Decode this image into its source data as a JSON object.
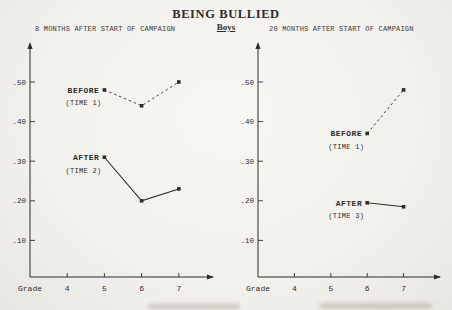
{
  "page": {
    "title": "BEING BULLIED",
    "group_label": "Boys"
  },
  "colors": {
    "ink": "#2e2d2b",
    "paper": "#f2f0ec"
  },
  "chart_data": [
    {
      "type": "line",
      "title": "8 MONTHS AFTER START OF CAMPAIGN",
      "xlabel": "Grade",
      "x_ticks": [
        4,
        5,
        6,
        7
      ],
      "y_ticks": [
        ".10",
        ".20",
        ".30",
        ".40",
        ".50"
      ],
      "ylim": [
        0,
        0.57
      ],
      "xlim": [
        3,
        8
      ],
      "grid": false,
      "legend_position": "labels-at-first-point",
      "series": [
        {
          "name": "BEFORE",
          "sub": "(TIME 1)",
          "style": "dashed",
          "points": [
            {
              "x": 5,
              "y": 0.48
            },
            {
              "x": 6,
              "y": 0.44
            },
            {
              "x": 7,
              "y": 0.5
            }
          ]
        },
        {
          "name": "AFTER",
          "sub": "(TIME 2)",
          "style": "solid",
          "points": [
            {
              "x": 5,
              "y": 0.31
            },
            {
              "x": 6,
              "y": 0.2
            },
            {
              "x": 7,
              "y": 0.23
            }
          ]
        }
      ]
    },
    {
      "type": "line",
      "title": "20 MONTHS AFTER START OF CAMPAIGN",
      "xlabel": "Grade",
      "x_ticks": [
        4,
        5,
        6,
        7
      ],
      "y_ticks": [
        ".10",
        ".20",
        ".30",
        ".40",
        ".50"
      ],
      "ylim": [
        0,
        0.57
      ],
      "xlim": [
        3,
        8
      ],
      "grid": false,
      "legend_position": "labels-at-first-point",
      "series": [
        {
          "name": "BEFORE",
          "sub": "(TIME 1)",
          "style": "dashed",
          "points": [
            {
              "x": 6,
              "y": 0.37
            },
            {
              "x": 7,
              "y": 0.48
            }
          ]
        },
        {
          "name": "AFTER",
          "sub": "(TIME 3)",
          "style": "solid",
          "points": [
            {
              "x": 6,
              "y": 0.195
            },
            {
              "x": 7,
              "y": 0.185
            }
          ]
        }
      ]
    }
  ]
}
